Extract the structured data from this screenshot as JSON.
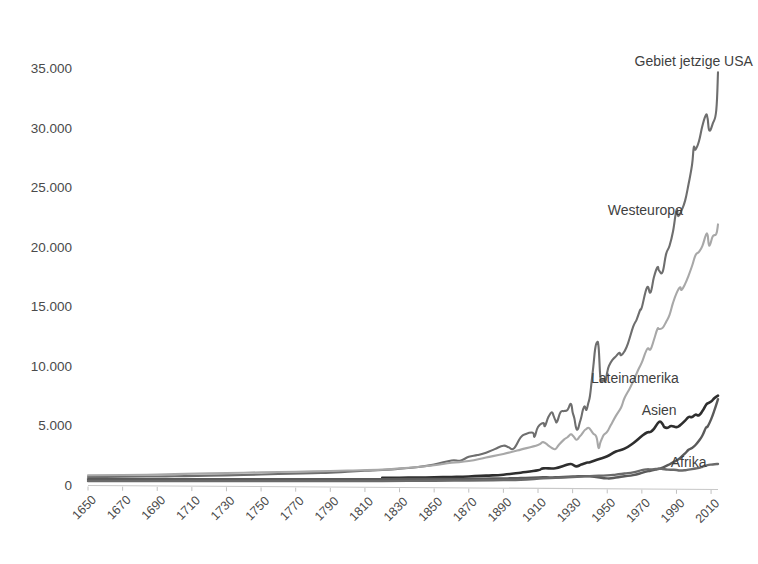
{
  "chart_data": {
    "type": "line",
    "title": "",
    "subtitle": "",
    "xlabel": "",
    "ylabel": "",
    "xlim": [
      1650,
      2014
    ],
    "ylim": [
      0,
      36500
    ],
    "grid": false,
    "legend_position": "inline-right-of-line-ends",
    "y_ticks": [
      0,
      5000,
      10000,
      15000,
      20000,
      25000,
      30000,
      35000
    ],
    "y_tick_labels": [
      "0",
      "5.000",
      "10.000",
      "15.000",
      "20.000",
      "25.000",
      "30.000",
      "35.000"
    ],
    "x_ticks": [
      1650,
      1670,
      1690,
      1710,
      1730,
      1750,
      1770,
      1790,
      1810,
      1830,
      1850,
      1870,
      1890,
      1910,
      1930,
      1950,
      1970,
      1990,
      2010
    ],
    "x_tick_labels": [
      "1650",
      "1670",
      "1690",
      "1710",
      "1730",
      "1750",
      "1770",
      "1790",
      "1810",
      "1830",
      "1850",
      "1870",
      "1890",
      "1910",
      "1930",
      "1950",
      "1970",
      "1990",
      "2010"
    ],
    "series": [
      {
        "name": "Gebiet jetzige USA",
        "color": "#6e6e6e",
        "width": 2.1,
        "label_x": 2000,
        "label_y": 35600,
        "label_anchor": "middle",
        "x": [
          1650,
          1670,
          1690,
          1700,
          1720,
          1740,
          1760,
          1780,
          1790,
          1800,
          1810,
          1820,
          1830,
          1840,
          1850,
          1860,
          1865,
          1870,
          1875,
          1880,
          1885,
          1890,
          1893,
          1896,
          1900,
          1903,
          1907,
          1908,
          1910,
          1913,
          1914,
          1916,
          1918,
          1919,
          1920,
          1921,
          1923,
          1925,
          1927,
          1929,
          1930,
          1931,
          1932,
          1933,
          1934,
          1935,
          1936,
          1937,
          1938,
          1939,
          1940,
          1941,
          1942,
          1943,
          1944,
          1945,
          1946,
          1947,
          1948,
          1949,
          1950,
          1951,
          1953,
          1955,
          1957,
          1958,
          1960,
          1962,
          1965,
          1967,
          1969,
          1970,
          1973,
          1975,
          1977,
          1979,
          1980,
          1982,
          1984,
          1986,
          1988,
          1990,
          1991,
          1993,
          1995,
          1997,
          1999,
          2000,
          2001,
          2003,
          2005,
          2007,
          2008,
          2009,
          2011,
          2013,
          2014
        ],
        "y": [
          750,
          780,
          800,
          820,
          870,
          930,
          1010,
          1080,
          1120,
          1200,
          1280,
          1340,
          1450,
          1580,
          1800,
          2150,
          2130,
          2450,
          2600,
          2800,
          3100,
          3390,
          3250,
          3150,
          4090,
          4380,
          4480,
          4150,
          4960,
          5300,
          5050,
          5800,
          6200,
          5900,
          5550,
          5400,
          6200,
          6300,
          6400,
          6900,
          6210,
          5690,
          4910,
          4780,
          5270,
          5780,
          6430,
          6700,
          6400,
          6940,
          7550,
          8800,
          10100,
          11500,
          12050,
          11700,
          9200,
          8850,
          9000,
          8800,
          9560,
          10100,
          10600,
          10900,
          11200,
          11000,
          11330,
          12000,
          13400,
          14000,
          14800,
          15030,
          16690,
          16280,
          17570,
          18400,
          18100,
          18000,
          19500,
          20200,
          21400,
          23200,
          22700,
          23200,
          24000,
          25400,
          27000,
          28470,
          28300,
          29000,
          30300,
          31200,
          30900,
          29900,
          30500,
          31600,
          34800
        ],
        "end_value": 34800
      },
      {
        "name": "Westeuropa",
        "color": "#a8a8a8",
        "width": 2.1,
        "label_x": 1972,
        "label_y": 23100,
        "label_anchor": "middle",
        "x": [
          1650,
          1670,
          1690,
          1700,
          1720,
          1740,
          1760,
          1780,
          1800,
          1820,
          1830,
          1840,
          1850,
          1860,
          1870,
          1880,
          1890,
          1900,
          1910,
          1913,
          1916,
          1918,
          1920,
          1922,
          1925,
          1927,
          1929,
          1930,
          1931,
          1932,
          1933,
          1934,
          1935,
          1936,
          1937,
          1938,
          1939,
          1940,
          1941,
          1942,
          1943,
          1944,
          1945,
          1946,
          1947,
          1948,
          1950,
          1952,
          1955,
          1958,
          1960,
          1963,
          1965,
          1968,
          1970,
          1973,
          1975,
          1977,
          1979,
          1980,
          1982,
          1984,
          1986,
          1988,
          1990,
          1992,
          1993,
          1995,
          1997,
          1999,
          2001,
          2003,
          2005,
          2007,
          2008,
          2009,
          2011,
          2013,
          2014
        ],
        "y": [
          900,
          930,
          960,
          1000,
          1060,
          1120,
          1180,
          1230,
          1300,
          1380,
          1480,
          1600,
          1750,
          1950,
          2100,
          2400,
          2700,
          3060,
          3450,
          3690,
          3400,
          3200,
          3100,
          3450,
          3900,
          4100,
          4350,
          4250,
          4080,
          3900,
          3950,
          4150,
          4300,
          4500,
          4700,
          4800,
          4900,
          4800,
          4600,
          4400,
          4300,
          4000,
          3200,
          3650,
          4000,
          4300,
          4570,
          5100,
          5900,
          6600,
          7400,
          8200,
          8800,
          9800,
          10400,
          11500,
          11500,
          12300,
          13200,
          13200,
          13300,
          13800,
          14400,
          15400,
          16200,
          16700,
          16500,
          17000,
          17700,
          18500,
          19400,
          19700,
          20200,
          21100,
          21100,
          20200,
          21000,
          21200,
          22000
        ],
        "end_value": 22000
      },
      {
        "name": "Lateinamerika",
        "color": "#2e2e2e",
        "width": 2.6,
        "label_x": 1966,
        "label_y": 9000,
        "label_anchor": "middle",
        "x": [
          1820,
          1830,
          1840,
          1850,
          1860,
          1870,
          1880,
          1890,
          1900,
          1910,
          1913,
          1920,
          1925,
          1929,
          1932,
          1935,
          1938,
          1940,
          1945,
          1950,
          1955,
          1960,
          1965,
          1970,
          1973,
          1975,
          1977,
          1980,
          1982,
          1983,
          1985,
          1987,
          1990,
          1992,
          1995,
          1997,
          1999,
          2001,
          2003,
          2005,
          2007,
          2008,
          2010,
          2012,
          2014
        ],
        "y": [
          690,
          700,
          710,
          730,
          760,
          800,
          870,
          950,
          1120,
          1320,
          1480,
          1490,
          1700,
          1850,
          1650,
          1800,
          1960,
          2000,
          2250,
          2500,
          2900,
          3140,
          3600,
          4200,
          4500,
          4550,
          4800,
          5400,
          5200,
          4950,
          4900,
          5050,
          4950,
          5100,
          5500,
          5800,
          5800,
          6000,
          5950,
          6300,
          6800,
          6950,
          7100,
          7400,
          7600
        ],
        "end_value": 7600
      },
      {
        "name": "Asien",
        "color": "#5a5a5a",
        "width": 2.4,
        "label_x": 1980,
        "label_y": 6300,
        "label_anchor": "middle",
        "x": [
          1650,
          1700,
          1750,
          1800,
          1820,
          1850,
          1870,
          1890,
          1900,
          1913,
          1920,
          1930,
          1940,
          1950,
          1955,
          1960,
          1965,
          1970,
          1973,
          1975,
          1978,
          1980,
          1982,
          1985,
          1988,
          1990,
          1992,
          1995,
          1997,
          1999,
          2001,
          2003,
          2005,
          2007,
          2008,
          2010,
          2012,
          2014
        ],
        "y": [
          580,
          580,
          570,
          570,
          580,
          590,
          600,
          640,
          670,
          730,
          730,
          800,
          820,
          640,
          720,
          820,
          920,
          1100,
          1230,
          1280,
          1380,
          1450,
          1550,
          1750,
          2000,
          2150,
          2350,
          2750,
          3050,
          3200,
          3450,
          3800,
          4250,
          4900,
          5000,
          5600,
          6400,
          7300
        ],
        "end_value": 7300
      },
      {
        "name": "Afrika",
        "color": "#6a6a6a",
        "width": 2.4,
        "label_x": 1997,
        "label_y": 1900,
        "label_anchor": "middle",
        "x": [
          1650,
          1700,
          1750,
          1800,
          1820,
          1850,
          1870,
          1890,
          1900,
          1913,
          1920,
          1930,
          1940,
          1950,
          1955,
          1960,
          1965,
          1970,
          1973,
          1975,
          1978,
          1980,
          1982,
          1985,
          1988,
          1990,
          1992,
          1995,
          1997,
          1999,
          2001,
          2003,
          2005,
          2007,
          2008,
          2010,
          2012,
          2014
        ],
        "y": [
          420,
          420,
          420,
          420,
          420,
          440,
          460,
          500,
          530,
          640,
          680,
          750,
          830,
          890,
          960,
          1050,
          1140,
          1330,
          1400,
          1400,
          1430,
          1450,
          1430,
          1380,
          1370,
          1350,
          1300,
          1330,
          1380,
          1420,
          1470,
          1530,
          1620,
          1720,
          1760,
          1800,
          1830,
          1850
        ],
        "end_value": 1850
      }
    ]
  },
  "axes": {
    "plot_left": 88,
    "plot_right": 718,
    "plot_top": 52,
    "plot_bottom": 486
  }
}
